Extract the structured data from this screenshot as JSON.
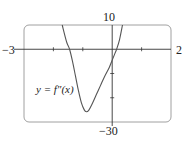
{
  "chart_data": {
    "type": "line",
    "title": "",
    "annotation": "y = f″(x)",
    "xlabel": "",
    "ylabel": "",
    "xlim": [
      -3,
      2
    ],
    "ylim": [
      -30,
      10
    ],
    "x_tick_step": 1,
    "y_tick_step": 10,
    "x_range_labels": {
      "min": "−3",
      "max": "2"
    },
    "y_range_labels": {
      "max": "10",
      "min": "−30"
    },
    "grid": false,
    "colors": {
      "curve": "#555555",
      "axes": "#333333",
      "frame": "#888888"
    },
    "series": [
      {
        "name": "f''(x)",
        "points": [
          [
            -1.7,
            10
          ],
          [
            -1.55,
            3
          ],
          [
            -1.45,
            0
          ],
          [
            -1.35,
            -5
          ],
          [
            -1.25,
            -11
          ],
          [
            -1.15,
            -17
          ],
          [
            -1.05,
            -22
          ],
          [
            -0.95,
            -25
          ],
          [
            -0.88,
            -25.8
          ],
          [
            -0.8,
            -25.2
          ],
          [
            -0.7,
            -23
          ],
          [
            -0.55,
            -19
          ],
          [
            -0.4,
            -15
          ],
          [
            -0.25,
            -11
          ],
          [
            -0.1,
            -7.5
          ],
          [
            0.0,
            -4.5
          ],
          [
            0.1,
            -1.5
          ],
          [
            0.15,
            0
          ],
          [
            0.25,
            4
          ],
          [
            0.35,
            10
          ]
        ]
      }
    ]
  }
}
